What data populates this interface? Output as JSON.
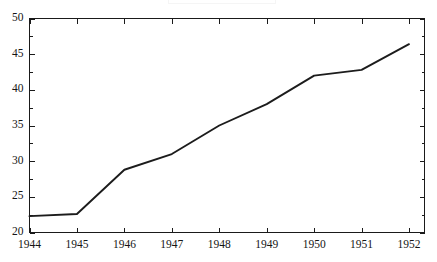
{
  "chart_data": {
    "type": "line",
    "title": "",
    "subtitle": "",
    "xlabel": "",
    "ylabel": "",
    "categories": [
      "1944",
      "1945",
      "1946",
      "1947",
      "1948",
      "1949",
      "1950",
      "1951",
      "1952"
    ],
    "x": [
      1944,
      1945,
      1946,
      1947,
      1948,
      1949,
      1950,
      1951,
      1952
    ],
    "values": [
      22.3,
      22.6,
      28.8,
      31.0,
      35.0,
      38.0,
      42.0,
      42.8,
      46.4
    ],
    "series": [
      {
        "name": "",
        "values": [
          22.3,
          22.6,
          28.8,
          31.0,
          35.0,
          38.0,
          42.0,
          42.8,
          46.4
        ],
        "color": "#1c1c1c"
      }
    ],
    "xlim": [
      1944,
      1952
    ],
    "ylim": [
      20,
      50
    ],
    "ytick_labels": [
      "20",
      "25",
      "30",
      "35",
      "40",
      "45",
      "50"
    ],
    "ytick_values": [
      20,
      25,
      30,
      35,
      40,
      45,
      50
    ],
    "yminor_values": [
      22.5,
      27.5,
      32.5,
      37.5,
      42.5,
      47.5
    ],
    "xtick_labels": [
      "1944",
      "1945",
      "1946",
      "1947",
      "1948",
      "1949",
      "1950",
      "1951",
      "1952"
    ],
    "grid": false,
    "legend": false,
    "legend_position": "none",
    "annotations": []
  },
  "frame": {
    "border_color": "#1a1a1a",
    "background": "#ffffff"
  }
}
